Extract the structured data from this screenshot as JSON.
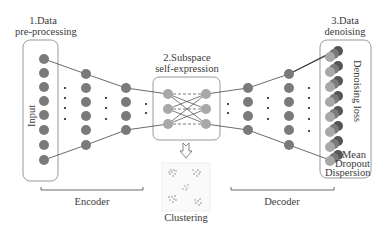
{
  "diagram": {
    "stages": [
      {
        "line1": "1.Data",
        "line2": "pre-processing"
      },
      {
        "line1": "2.Subspace",
        "line2": "self-expression"
      },
      {
        "line1": "3.Data",
        "line2": "denoising"
      }
    ],
    "input_label": "Input",
    "denoising_label": "Denoising loss",
    "output_params": [
      "Mean",
      "Dropout",
      "Dispersion"
    ],
    "encoder_label": "Encoder",
    "decoder_label": "Decoder",
    "clustering_label": "Clustering",
    "layers": {
      "input_nodes": 8,
      "encoder_hidden_1": 6,
      "encoder_hidden_2": 4,
      "self_expression_left": 3,
      "self_expression_right": 3,
      "decoder_hidden_1": 4,
      "decoder_hidden_2": 6,
      "output_stacks": 8
    },
    "colors": {
      "node_dark": "#7a7a7a",
      "node_light": "#a8a8a8",
      "node_darkest": "#555555",
      "box_border": "#9a9a9a",
      "line": "#444444"
    }
  }
}
